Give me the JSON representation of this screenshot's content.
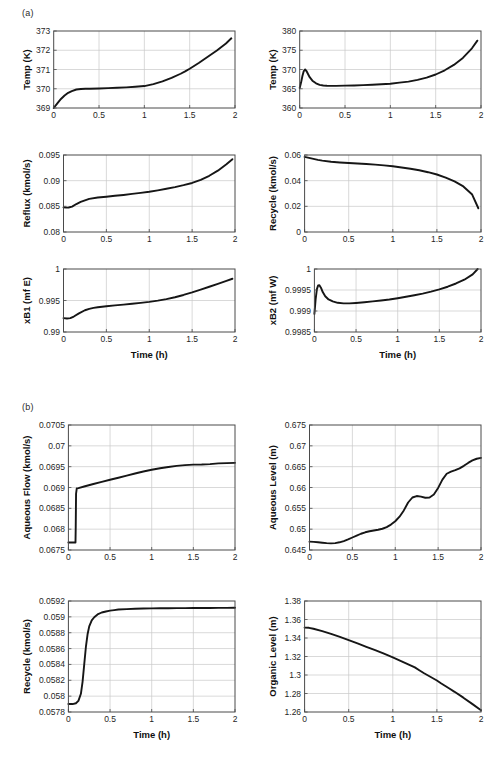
{
  "figure": {
    "panels": [
      {
        "id": "panel-a",
        "label": "(a)"
      },
      {
        "id": "panel-b",
        "label": "(b)"
      }
    ],
    "line_color": "#161616",
    "grid_color": "#c8c8c8",
    "axis_color": "#4a4a4a"
  },
  "chart_data": [
    {
      "id": "temp-k-left",
      "type": "line",
      "panel": "(a)",
      "title": "",
      "xlabel": "",
      "ylabel": "Temp (K)",
      "xlim": [
        0,
        2
      ],
      "ylim": [
        369,
        373
      ],
      "xticks": [
        0,
        0.5,
        1,
        1.5,
        2
      ],
      "xticklabels": [
        "0",
        "0.5",
        "1",
        "1.5",
        "2"
      ],
      "yticks": [
        369,
        370,
        371,
        372,
        373
      ],
      "yticklabels": [
        "369",
        "370",
        "371",
        "372",
        "373"
      ],
      "grid": true,
      "legend": null,
      "series": [
        {
          "name": "Temp",
          "x": [
            0,
            0.04,
            0.08,
            0.12,
            0.16,
            0.2,
            0.25,
            0.3,
            0.35,
            0.4,
            0.5,
            0.6,
            0.7,
            0.8,
            0.9,
            1.0,
            1.1,
            1.2,
            1.3,
            1.4,
            1.45,
            1.5,
            1.6,
            1.7,
            1.8,
            1.9,
            1.96
          ],
          "y": [
            369.0,
            369.24,
            369.47,
            369.65,
            369.79,
            369.88,
            369.96,
            369.99,
            370.0,
            370.0,
            370.01,
            370.03,
            370.05,
            370.07,
            370.1,
            370.14,
            370.24,
            370.38,
            370.56,
            370.78,
            370.9,
            371.04,
            371.34,
            371.66,
            371.99,
            372.35,
            372.62
          ]
        }
      ]
    },
    {
      "id": "temp-k-right",
      "type": "line",
      "panel": "(a)",
      "title": "",
      "xlabel": "",
      "ylabel": "Temp (K)",
      "xlim": [
        0,
        2
      ],
      "ylim": [
        360,
        380
      ],
      "xticks": [
        0,
        0.5,
        1,
        1.5,
        2
      ],
      "xticklabels": [
        "0",
        "0.5",
        "1",
        "1.5",
        "2"
      ],
      "yticks": [
        360,
        365,
        370,
        375,
        380
      ],
      "yticklabels": [
        "360",
        "365",
        "370",
        "375",
        "380"
      ],
      "grid": true,
      "legend": null,
      "series": [
        {
          "name": "Temp",
          "x": [
            0,
            0.015,
            0.03,
            0.045,
            0.06,
            0.075,
            0.09,
            0.11,
            0.14,
            0.18,
            0.22,
            0.26,
            0.3,
            0.35,
            0.4,
            0.5,
            0.6,
            0.7,
            0.8,
            0.9,
            1.0,
            1.1,
            1.2,
            1.3,
            1.4,
            1.5,
            1.6,
            1.7,
            1.8,
            1.9,
            1.96
          ],
          "y": [
            365.2,
            366.6,
            368.3,
            369.6,
            370.0,
            369.6,
            368.9,
            368.0,
            367.1,
            366.4,
            366.0,
            365.85,
            365.78,
            365.74,
            365.75,
            365.8,
            365.86,
            365.94,
            366.04,
            366.15,
            366.3,
            366.6,
            366.85,
            367.3,
            367.9,
            368.7,
            369.8,
            371.2,
            373.0,
            375.5,
            377.5
          ]
        }
      ]
    },
    {
      "id": "reflux-kmol-s",
      "type": "line",
      "panel": "(a)",
      "title": "",
      "xlabel": "",
      "ylabel": "Reflux (kmol/s)",
      "xlim": [
        0,
        2
      ],
      "ylim": [
        0.08,
        0.095
      ],
      "xticks": [
        0,
        0.5,
        1,
        1.5,
        2
      ],
      "xticklabels": [
        "0",
        "0.5",
        "1",
        "1.5",
        "2"
      ],
      "yticks": [
        0.08,
        0.085,
        0.09,
        0.095
      ],
      "yticklabels": [
        "0.08",
        "0.085",
        "0.09",
        "0.095"
      ],
      "grid": true,
      "legend": null,
      "series": [
        {
          "name": "Reflux",
          "x": [
            0,
            0.03,
            0.06,
            0.1,
            0.15,
            0.2,
            0.25,
            0.3,
            0.4,
            0.5,
            0.6,
            0.7,
            0.8,
            0.9,
            1.0,
            1.1,
            1.2,
            1.3,
            1.4,
            1.5,
            1.6,
            1.7,
            1.8,
            1.9,
            1.97
          ],
          "y": [
            0.0848,
            0.08475,
            0.08478,
            0.08495,
            0.08545,
            0.08585,
            0.08615,
            0.08645,
            0.08672,
            0.08688,
            0.08705,
            0.08722,
            0.08742,
            0.08762,
            0.08785,
            0.08812,
            0.08842,
            0.08875,
            0.08912,
            0.08955,
            0.09015,
            0.09095,
            0.09195,
            0.09318,
            0.09418
          ]
        }
      ]
    },
    {
      "id": "recycle-kmol-s-a",
      "type": "line",
      "panel": "(a)",
      "title": "",
      "xlabel": "",
      "ylabel": "Recycle (kmol/s)",
      "xlim": [
        0,
        2
      ],
      "ylim": [
        0,
        0.06
      ],
      "xticks": [
        0,
        0.5,
        1,
        1.5,
        2
      ],
      "xticklabels": [
        "0",
        "0.5",
        "1",
        "1.5",
        "2"
      ],
      "yticks": [
        0,
        0.02,
        0.04,
        0.06
      ],
      "yticklabels": [
        "0",
        "0.02",
        "0.04",
        "0.06"
      ],
      "grid": true,
      "legend": null,
      "series": [
        {
          "name": "Recycle",
          "x": [
            0,
            0.05,
            0.1,
            0.15,
            0.2,
            0.3,
            0.4,
            0.5,
            0.6,
            0.7,
            0.8,
            0.9,
            1.0,
            1.1,
            1.2,
            1.3,
            1.4,
            1.5,
            1.6,
            1.7,
            1.8,
            1.9,
            1.97
          ],
          "y": [
            0.0585,
            0.0578,
            0.057,
            0.0562,
            0.0556,
            0.0547,
            0.0542,
            0.0538,
            0.0534,
            0.053,
            0.0525,
            0.0519,
            0.0512,
            0.0503,
            0.0493,
            0.0481,
            0.0466,
            0.0448,
            0.0424,
            0.0394,
            0.0355,
            0.0292,
            0.0185
          ]
        }
      ]
    },
    {
      "id": "xb1-mf-e",
      "type": "line",
      "panel": "(a)",
      "title": "",
      "xlabel": "Time (h)",
      "ylabel": "xB1 (mf E)",
      "xlim": [
        0,
        2
      ],
      "ylim": [
        0.99,
        1
      ],
      "xticks": [
        0,
        0.5,
        1,
        1.5,
        2
      ],
      "xticklabels": [
        "0",
        "0.5",
        "1",
        "1.5",
        "2"
      ],
      "yticks": [
        0.99,
        0.995,
        1
      ],
      "yticklabels": [
        "0.99",
        "0.995",
        "1"
      ],
      "grid": true,
      "legend": null,
      "series": [
        {
          "name": "xB1",
          "x": [
            0,
            0.04,
            0.08,
            0.12,
            0.18,
            0.25,
            0.3,
            0.35,
            0.4,
            0.5,
            0.6,
            0.7,
            0.8,
            0.9,
            1.0,
            1.1,
            1.2,
            1.3,
            1.4,
            1.5,
            1.6,
            1.7,
            1.8,
            1.9,
            1.97
          ],
          "y": [
            0.9922,
            0.99215,
            0.9922,
            0.99245,
            0.99295,
            0.99345,
            0.99368,
            0.99382,
            0.99392,
            0.99408,
            0.99422,
            0.99435,
            0.99448,
            0.99462,
            0.99478,
            0.99498,
            0.99522,
            0.99552,
            0.99588,
            0.99628,
            0.99672,
            0.99718,
            0.99765,
            0.99812,
            0.99845
          ]
        }
      ]
    },
    {
      "id": "xb2-mf-w",
      "type": "line",
      "panel": "(a)",
      "title": "",
      "xlabel": "Time (h)",
      "ylabel": "xB2 (mf W)",
      "xlim": [
        0,
        2
      ],
      "ylim": [
        0.9985,
        1
      ],
      "xticks": [
        0,
        0.5,
        1,
        1.5,
        2
      ],
      "xticklabels": [
        "0",
        "0.5",
        "1",
        "1.5",
        "2"
      ],
      "yticks": [
        0.9985,
        0.999,
        0.9995,
        1
      ],
      "yticklabels": [
        "0.9985",
        "0.999",
        "0.9995",
        "1"
      ],
      "grid": true,
      "legend": null,
      "series": [
        {
          "name": "xB2",
          "x": [
            0,
            0.015,
            0.03,
            0.045,
            0.06,
            0.08,
            0.1,
            0.13,
            0.17,
            0.22,
            0.28,
            0.35,
            0.42,
            0.5,
            0.6,
            0.7,
            0.8,
            0.9,
            1.0,
            1.1,
            1.2,
            1.3,
            1.4,
            1.5,
            1.6,
            1.7,
            1.8,
            1.9,
            1.96
          ],
          "y": [
            0.99893,
            0.99928,
            0.99952,
            0.99961,
            0.999615,
            0.99955,
            0.99945,
            0.99935,
            0.999275,
            0.99923,
            0.999195,
            0.999182,
            0.999182,
            0.999192,
            0.999208,
            0.999228,
            0.99925,
            0.999275,
            0.999305,
            0.999338,
            0.999375,
            0.999415,
            0.999462,
            0.999515,
            0.999578,
            0.999655,
            0.999745,
            0.999872,
            1.0
          ]
        }
      ]
    },
    {
      "id": "aqueous-flow-kmol-s",
      "type": "line",
      "panel": "(b)",
      "title": "",
      "xlabel": "",
      "ylabel": "Aqueous Flow (kmol/s)",
      "xlim": [
        0,
        2
      ],
      "ylim": [
        0.0675,
        0.0705
      ],
      "xticks": [
        0,
        0.5,
        1,
        1.5,
        2
      ],
      "xticklabels": [
        "0",
        "0.5",
        "1",
        "1.5",
        "2"
      ],
      "yticks": [
        0.0675,
        0.068,
        0.0685,
        0.069,
        0.0695,
        0.07,
        0.0705
      ],
      "yticklabels": [
        "0.0675",
        "0.068",
        "0.0685",
        "0.069",
        "0.0695",
        "0.07",
        "0.0705"
      ],
      "grid": true,
      "legend": null,
      "series": [
        {
          "name": "Aqueous Flow",
          "x": [
            0,
            0.04,
            0.085,
            0.088,
            0.092,
            0.1,
            0.12,
            0.2,
            0.3,
            0.4,
            0.5,
            0.6,
            0.7,
            0.8,
            0.9,
            1.0,
            1.1,
            1.2,
            1.3,
            1.4,
            1.5,
            1.6,
            1.7,
            1.8,
            1.9,
            2.0
          ],
          "y": [
            0.06768,
            0.06768,
            0.06768,
            0.06805,
            0.06885,
            0.068975,
            0.068985,
            0.06903,
            0.069085,
            0.069135,
            0.069185,
            0.069235,
            0.069285,
            0.069335,
            0.069385,
            0.069425,
            0.069462,
            0.069492,
            0.069518,
            0.069538,
            0.069548,
            0.069552,
            0.069562,
            0.069578,
            0.069585,
            0.069592
          ]
        }
      ]
    },
    {
      "id": "aqueous-level-m",
      "type": "line",
      "panel": "(b)",
      "title": "",
      "xlabel": "",
      "ylabel": "Aqueous Level (m)",
      "xlim": [
        0,
        2
      ],
      "ylim": [
        0.645,
        0.675
      ],
      "xticks": [
        0,
        0.5,
        1,
        1.5,
        2
      ],
      "xticklabels": [
        "0",
        "0.5",
        "1",
        "1.5",
        "2"
      ],
      "yticks": [
        0.645,
        0.65,
        0.655,
        0.66,
        0.665,
        0.67,
        0.675
      ],
      "yticklabels": [
        "0.645",
        "0.65",
        "0.655",
        "0.66",
        "0.665",
        "0.67",
        "0.675"
      ],
      "grid": true,
      "legend": null,
      "series": [
        {
          "name": "Aqueous Level",
          "x": [
            0,
            0.05,
            0.1,
            0.15,
            0.2,
            0.25,
            0.3,
            0.35,
            0.4,
            0.45,
            0.5,
            0.55,
            0.6,
            0.65,
            0.7,
            0.75,
            0.8,
            0.85,
            0.9,
            0.95,
            1.0,
            1.05,
            1.1,
            1.15,
            1.2,
            1.25,
            1.3,
            1.35,
            1.4,
            1.45,
            1.5,
            1.55,
            1.6,
            1.65,
            1.7,
            1.75,
            1.8,
            1.85,
            1.9,
            1.95,
            2.0
          ],
          "y": [
            0.647,
            0.64695,
            0.64685,
            0.64675,
            0.64665,
            0.6466,
            0.64665,
            0.64685,
            0.64715,
            0.64755,
            0.648,
            0.64845,
            0.6489,
            0.64925,
            0.6495,
            0.64968,
            0.64985,
            0.6501,
            0.6505,
            0.6511,
            0.6519,
            0.653,
            0.6545,
            0.6564,
            0.6576,
            0.65795,
            0.6578,
            0.65755,
            0.6576,
            0.6583,
            0.6599,
            0.6619,
            0.6633,
            0.6638,
            0.66415,
            0.6646,
            0.6652,
            0.6659,
            0.6665,
            0.6669,
            0.6671
          ]
        }
      ]
    },
    {
      "id": "recycle-kmol-s-b",
      "type": "line",
      "panel": "(b)",
      "title": "",
      "xlabel": "Time (h)",
      "ylabel": "Recycle (kmol/s)",
      "xlim": [
        0,
        2
      ],
      "ylim": [
        0.0578,
        0.0592
      ],
      "xticks": [
        0,
        0.5,
        1,
        1.5,
        2
      ],
      "xticklabels": [
        "0",
        "0.5",
        "1",
        "1.5",
        "2"
      ],
      "yticks": [
        0.0578,
        0.058,
        0.0582,
        0.0584,
        0.0586,
        0.0588,
        0.059,
        0.0592
      ],
      "yticklabels": [
        "0.0578",
        "0.058",
        "0.0582",
        "0.0584",
        "0.0586",
        "0.0588",
        "0.059",
        "0.0592"
      ],
      "grid": true,
      "legend": null,
      "series": [
        {
          "name": "Recycle",
          "x": [
            0,
            0.05,
            0.09,
            0.12,
            0.15,
            0.17,
            0.19,
            0.21,
            0.23,
            0.25,
            0.28,
            0.31,
            0.35,
            0.4,
            0.45,
            0.5,
            0.55,
            0.6,
            0.7,
            0.8,
            0.9,
            1.0,
            1.1,
            1.2,
            1.3,
            1.4,
            1.5,
            1.6,
            1.7,
            1.8,
            1.9,
            2.0
          ],
          "y": [
            0.0579,
            0.0579,
            0.05791,
            0.05794,
            0.05803,
            0.05818,
            0.0584,
            0.05862,
            0.05878,
            0.05888,
            0.058955,
            0.058995,
            0.05903,
            0.059055,
            0.059068,
            0.059078,
            0.059085,
            0.059092,
            0.059098,
            0.059102,
            0.059105,
            0.059107,
            0.059108,
            0.059109,
            0.05911,
            0.05911,
            0.059111,
            0.059112,
            0.059112,
            0.059113,
            0.059113,
            0.059114
          ]
        }
      ]
    },
    {
      "id": "organic-level-m",
      "type": "line",
      "panel": "(b)",
      "title": "",
      "xlabel": "Time (h)",
      "ylabel": "Organic Level (m)",
      "xlim": [
        0,
        2
      ],
      "ylim": [
        1.26,
        1.38
      ],
      "xticks": [
        0,
        0.5,
        1,
        1.5,
        2
      ],
      "xticklabels": [
        "0",
        "0.5",
        "1",
        "1.5",
        "2"
      ],
      "yticks": [
        1.26,
        1.28,
        1.3,
        1.32,
        1.34,
        1.36,
        1.38
      ],
      "yticklabels": [
        "1.26",
        "1.28",
        "1.3",
        "1.32",
        "1.34",
        "1.36",
        "1.38"
      ],
      "grid": true,
      "legend": null,
      "series": [
        {
          "name": "Organic Level",
          "x": [
            0,
            0.05,
            0.1,
            0.2,
            0.3,
            0.4,
            0.5,
            0.6,
            0.7,
            0.8,
            0.9,
            1.0,
            1.1,
            1.2,
            1.25,
            1.3,
            1.35,
            1.4,
            1.5,
            1.55,
            1.6,
            1.65,
            1.7,
            1.8,
            1.9,
            2.0
          ],
          "y": [
            1.3512,
            1.351,
            1.35,
            1.3475,
            1.3445,
            1.3412,
            1.3378,
            1.3342,
            1.3305,
            1.3268,
            1.323,
            1.319,
            1.3148,
            1.3105,
            1.3082,
            1.3052,
            1.3022,
            1.2995,
            1.294,
            1.2908,
            1.2878,
            1.2848,
            1.2818,
            1.2755,
            1.2688,
            1.262
          ]
        }
      ]
    }
  ]
}
